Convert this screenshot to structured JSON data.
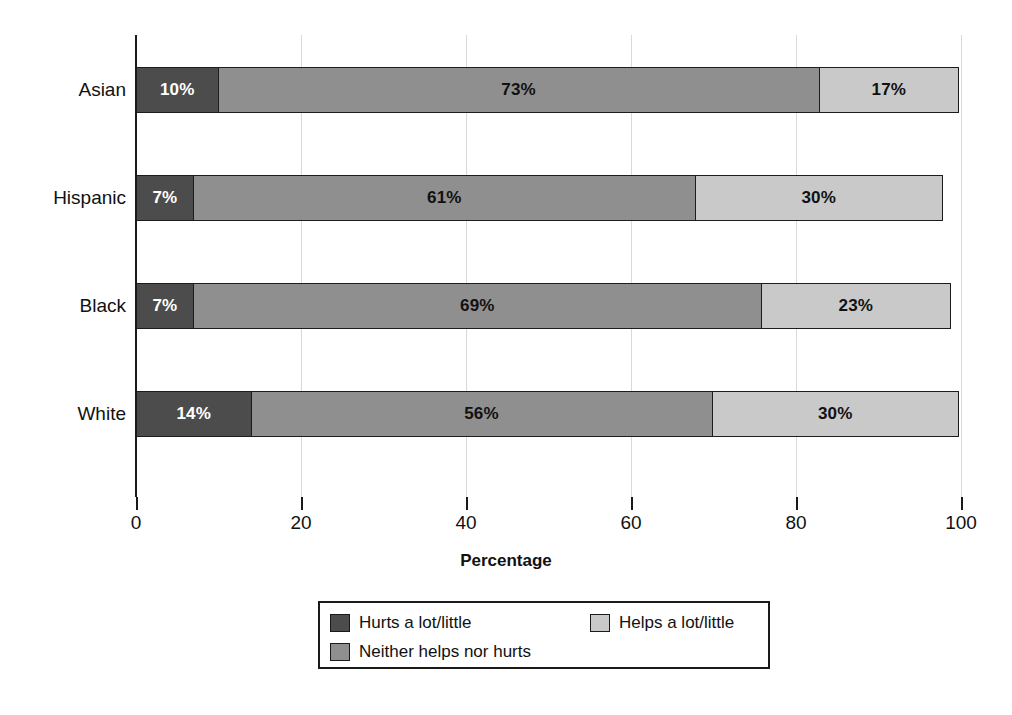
{
  "chart_data": {
    "type": "bar",
    "orientation": "horizontal",
    "stacked": true,
    "title": "",
    "xlabel": "Percentage",
    "ylabel": "",
    "xlim": [
      0,
      100
    ],
    "xticks": [
      0,
      20,
      40,
      60,
      80,
      100
    ],
    "xtick_labels": [
      "0",
      "20",
      "40",
      "60",
      "80",
      "100"
    ],
    "grid": "vertical",
    "legend_position": "bottom",
    "categories": [
      "Asian",
      "Hispanic",
      "Black",
      "White"
    ],
    "series": [
      {
        "name": "Hurts a lot/little",
        "color": "#4c4c4c",
        "values": [
          10,
          7,
          7,
          14
        ],
        "labels": [
          "10%",
          "7%",
          "7%",
          "14%"
        ]
      },
      {
        "name": "Neither helps nor hurts",
        "color": "#8f8f8f",
        "values": [
          73,
          61,
          69,
          56
        ],
        "labels": [
          "73%",
          "61%",
          "69%",
          "56%"
        ]
      },
      {
        "name": "Helps a lot/little",
        "color": "#c9c9c9",
        "values": [
          17,
          30,
          23,
          30
        ],
        "labels": [
          "17%",
          "30%",
          "23%",
          "30%"
        ]
      }
    ]
  },
  "legend": {
    "entries": [
      {
        "label": "Hurts a lot/little",
        "color": "#4c4c4c"
      },
      {
        "label": "Helps a lot/little",
        "color": "#c9c9c9"
      },
      {
        "label": "Neither helps nor hurts",
        "color": "#8f8f8f"
      }
    ]
  }
}
